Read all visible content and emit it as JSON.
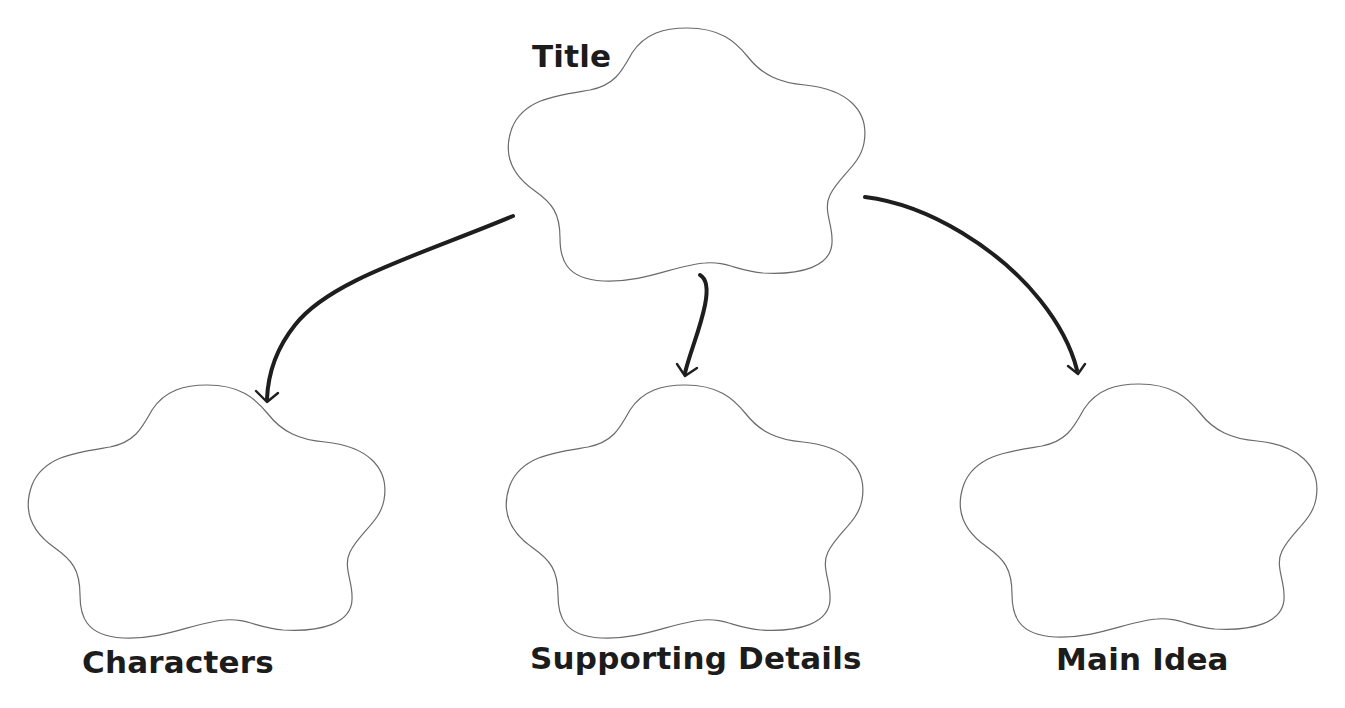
{
  "diagram": {
    "type": "web-organizer",
    "nodes": [
      {
        "id": "title",
        "label": "Title"
      },
      {
        "id": "characters",
        "label": "Characters"
      },
      {
        "id": "supporting_details",
        "label": "Supporting Details"
      },
      {
        "id": "main_idea",
        "label": "Main Idea"
      }
    ],
    "edges": [
      {
        "from": "title",
        "to": "characters"
      },
      {
        "from": "title",
        "to": "supporting_details"
      },
      {
        "from": "title",
        "to": "main_idea"
      }
    ]
  },
  "labels": {
    "title": "Title",
    "characters": "Characters",
    "supporting_details": "Supporting Details",
    "main_idea": "Main Idea"
  },
  "colors": {
    "background": "#ffffff",
    "cloud_stroke": "#6a6a6a",
    "arrow": "#1e1e1e",
    "text": "#1c1c1c"
  }
}
